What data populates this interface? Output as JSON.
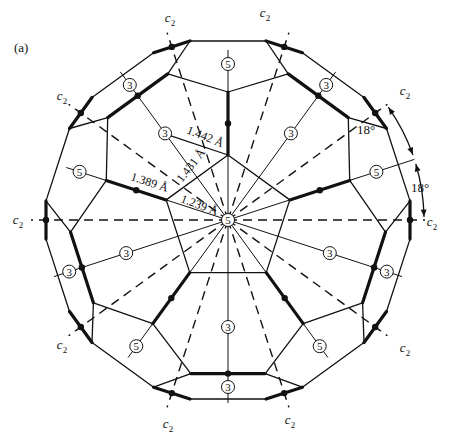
{
  "panel_label": "(a)",
  "geometry": {
    "center": [
      228,
      220
    ],
    "pentagon_radius": 65,
    "r2_radius": 128,
    "r3_radius": 158,
    "r3_half_spread_deg": 13.6,
    "outer_radius": 183,
    "outer_offsets_deg": [
      12,
      24
    ]
  },
  "axes": {
    "c2_label": "c",
    "c2_subscript": "2",
    "c2_angles_deg": [
      18,
      54,
      90,
      126,
      162,
      198,
      234,
      270,
      306,
      342
    ],
    "c2_label_positions": [
      [
        265,
        17
      ],
      [
        405,
        95
      ],
      [
        432,
        226
      ],
      [
        405,
        352
      ],
      [
        290,
        424
      ],
      [
        168,
        428
      ],
      [
        62,
        349
      ],
      [
        18,
        224
      ],
      [
        62,
        100
      ],
      [
        170,
        22
      ]
    ],
    "c5_angles_deg": [
      0,
      72,
      144,
      216,
      288
    ],
    "c3_angles_deg": [
      36,
      108,
      180,
      252,
      324
    ]
  },
  "symmetry_labels": {
    "five_fold": "5",
    "three_fold": "3",
    "center": "5"
  },
  "bond_labels": [
    {
      "text": "1.442 Å",
      "x": 186,
      "y": 133,
      "rotate": 22
    },
    {
      "text": "1.431 Å",
      "x": 182,
      "y": 183,
      "rotate": -52
    },
    {
      "text": "1.389 Å",
      "x": 130,
      "y": 180,
      "rotate": 18
    },
    {
      "text": "1.239 Å",
      "x": 180,
      "y": 202,
      "rotate": 20
    }
  ],
  "angle_annotations": [
    {
      "text": "18°",
      "x": 366,
      "y": 134
    },
    {
      "text": "18°",
      "x": 420,
      "y": 192
    }
  ]
}
